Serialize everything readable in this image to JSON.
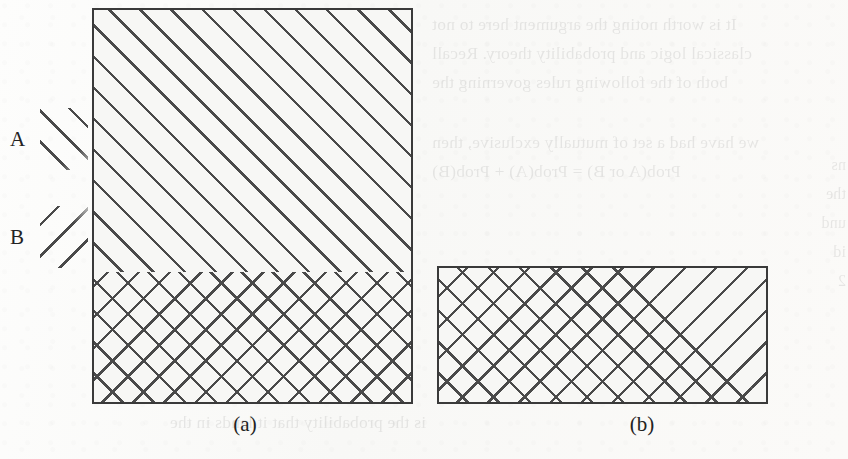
{
  "figure": {
    "kind": "venn-style-hatched-rectangles",
    "legend": {
      "items": [
        {
          "label": "A",
          "pattern": "forward-slash-hatch",
          "pattern_symbol": "///"
        },
        {
          "label": "B",
          "pattern": "back-slash-hatch",
          "pattern_symbol": "\\\\\\"
        }
      ]
    },
    "panels": [
      {
        "caption": "(a)",
        "regions": [
          {
            "name": "upper",
            "fill": "A only",
            "patterns": [
              "A"
            ]
          },
          {
            "name": "lower",
            "fill": "A and B overlap",
            "patterns": [
              "A",
              "B"
            ]
          }
        ]
      },
      {
        "caption": "(b)",
        "regions": [
          {
            "name": "left",
            "fill": "A and B overlap",
            "patterns": [
              "A",
              "B"
            ]
          },
          {
            "name": "right-triangle",
            "fill": "B only",
            "patterns": [
              "B"
            ]
          }
        ]
      }
    ],
    "colors": {
      "hatch_line": "#4a4a4a",
      "border": "#3a3a3a",
      "fill": "#f7f7f5",
      "page": "#fbfbfa",
      "text": "#232323"
    }
  },
  "ghost_text": {
    "top_right": "It is worth noting the argument here to not\nclassical logic and probability theory. Recall\nboth of the following rules governing the",
    "mid_right": "we have had a set of mutually exclusive, then\n           Prob(A or B) = Prob(A) + Prob(B)",
    "bottom_left": "is the probability that it lands in the",
    "far_right": "ns\nthe\nund\nid\n2"
  }
}
